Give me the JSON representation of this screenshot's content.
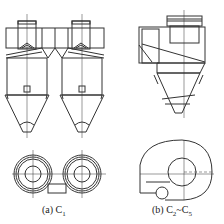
{
  "figure": {
    "panels": [
      {
        "id": "a",
        "label_prefix": "(a) C",
        "label_sub": "1",
        "description": "twin cyclone elevation and plan view"
      },
      {
        "id": "b",
        "label_prefix": "(b) C",
        "label_sub": "2",
        "label_mid": "~C",
        "label_sub2": "5",
        "description": "single cyclone elevation and volute plan view"
      }
    ],
    "line_color": "#333333"
  }
}
